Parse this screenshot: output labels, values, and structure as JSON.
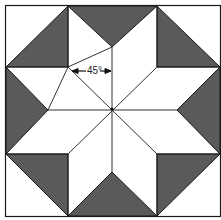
{
  "diagram": {
    "angle_label": "45°",
    "colors": {
      "dark": "#5a5a5a",
      "light": "#ffffff",
      "line": "#1a1a1a"
    }
  }
}
